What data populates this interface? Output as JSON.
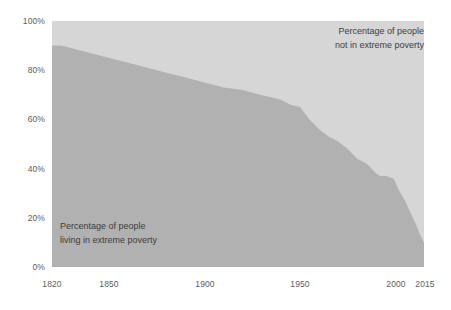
{
  "chart_data": {
    "type": "area",
    "title": "",
    "subtitle": "",
    "xlabel": "",
    "ylabel": "",
    "xlim": [
      1820,
      2015
    ],
    "ylim": [
      0,
      100
    ],
    "grid": false,
    "legend_position": "in-plot annotations",
    "stacked": true,
    "x_ticks": [
      "1820",
      "1850",
      "1900",
      "1950",
      "2000",
      "2015"
    ],
    "x_tick_values": [
      1820,
      1850,
      1900,
      1950,
      2000,
      2015
    ],
    "y_ticks": [
      "0%",
      "20%",
      "40%",
      "60%",
      "80%",
      "100%"
    ],
    "y_tick_values": [
      0,
      20,
      40,
      60,
      80,
      100
    ],
    "series": [
      {
        "name": "Percentage of people living in extreme poverty",
        "color": "#b1b1b1",
        "x": [
          1820,
          1825,
          1830,
          1835,
          1840,
          1845,
          1850,
          1860,
          1870,
          1880,
          1890,
          1900,
          1910,
          1920,
          1929,
          1935,
          1940,
          1945,
          1950,
          1955,
          1960,
          1965,
          1970,
          1975,
          1980,
          1985,
          1990,
          1992,
          1995,
          1999,
          2002,
          2005,
          2008,
          2011,
          2013,
          2015
        ],
        "values": [
          90,
          90,
          89,
          88,
          87,
          86,
          85,
          83,
          81,
          79,
          77,
          75,
          73,
          72,
          70,
          69,
          68,
          66,
          65,
          60,
          56,
          53,
          51,
          48,
          44,
          42,
          38,
          37,
          37,
          36,
          31,
          27,
          22,
          17,
          13,
          10
        ]
      },
      {
        "name": "Percentage of people not in extreme poverty",
        "color": "#d6d6d6",
        "x": [
          1820,
          1825,
          1830,
          1835,
          1840,
          1845,
          1850,
          1860,
          1870,
          1880,
          1890,
          1900,
          1910,
          1920,
          1929,
          1935,
          1940,
          1945,
          1950,
          1955,
          1960,
          1965,
          1970,
          1975,
          1980,
          1985,
          1990,
          1992,
          1995,
          1999,
          2002,
          2005,
          2008,
          2011,
          2013,
          2015
        ],
        "values": [
          10,
          10,
          11,
          12,
          13,
          14,
          15,
          17,
          19,
          21,
          23,
          25,
          27,
          28,
          30,
          31,
          32,
          34,
          35,
          40,
          44,
          47,
          49,
          52,
          56,
          58,
          62,
          63,
          63,
          64,
          69,
          73,
          78,
          83,
          87,
          90
        ]
      }
    ],
    "annotations": [
      {
        "name": "upper-area-label",
        "line1": "Percentage of people",
        "line2": "not in extreme poverty"
      },
      {
        "name": "lower-area-label",
        "line1": "Percentage of people",
        "line2": "living in extreme poverty"
      }
    ]
  },
  "axes": {
    "y": {
      "ticks": [
        {
          "label": "100%",
          "value": 100
        },
        {
          "label": "80%",
          "value": 80
        },
        {
          "label": "60%",
          "value": 60
        },
        {
          "label": "40%",
          "value": 40
        },
        {
          "label": "20%",
          "value": 20
        },
        {
          "label": "0%",
          "value": 0
        }
      ]
    },
    "x": {
      "ticks": [
        {
          "label": "1820",
          "value": 1820
        },
        {
          "label": "1850",
          "value": 1850
        },
        {
          "label": "1900",
          "value": 1900
        },
        {
          "label": "1950",
          "value": 1950
        },
        {
          "label": "2000",
          "value": 2000
        },
        {
          "label": "2015",
          "value": 2015
        }
      ]
    }
  },
  "colors": {
    "upper_area": "#d6d6d6",
    "lower_area": "#b1b1b1",
    "tick_text": "#5c5c5c",
    "annotation_text": "#3d3d3d",
    "background": "#ffffff"
  }
}
